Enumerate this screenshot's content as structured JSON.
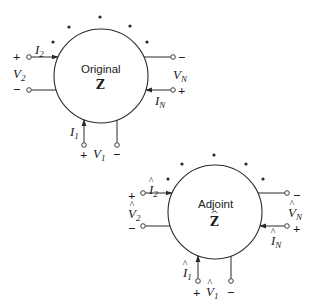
{
  "colors": {
    "stroke": "#2a2a2a",
    "background": "#ffffff"
  },
  "networks": [
    {
      "id": "original",
      "title": "Original",
      "matrix": "Z",
      "hat": false,
      "circle": {
        "cx": 101,
        "cy": 76,
        "r": 47
      },
      "dots": [
        [
          53,
          42
        ],
        [
          69,
          27
        ],
        [
          100,
          17
        ],
        [
          130,
          26
        ],
        [
          147,
          42
        ]
      ],
      "ports": {
        "port2": {
          "current": "I",
          "current_sub": "2",
          "voltage": "V",
          "voltage_sub": "2",
          "plus": "+",
          "minus": "−"
        },
        "portN": {
          "current": "I",
          "current_sub": "N",
          "voltage": "V",
          "voltage_sub": "N",
          "plus": "+",
          "minus": "−"
        },
        "port1": {
          "current": "I",
          "current_sub": "1",
          "voltage": "V",
          "voltage_sub": "1",
          "plus": "+",
          "minus": "−"
        }
      }
    },
    {
      "id": "adjoint",
      "title": "Adjoint",
      "matrix": "Z",
      "hat": true,
      "hat_glyph": "^",
      "circle": {
        "cx": 215,
        "cy": 212,
        "r": 47
      },
      "dots": [
        [
          168,
          179
        ],
        [
          182,
          164
        ],
        [
          214,
          155
        ],
        [
          246,
          164
        ],
        [
          263,
          179
        ]
      ],
      "ports": {
        "port2": {
          "current": "I",
          "current_sub": "2",
          "voltage": "V",
          "voltage_sub": "2",
          "plus": "+",
          "minus": "−"
        },
        "portN": {
          "current": "I",
          "current_sub": "N",
          "voltage": "V",
          "voltage_sub": "N",
          "plus": "+",
          "minus": "−"
        },
        "port1": {
          "current": "I",
          "current_sub": "1",
          "voltage": "V",
          "voltage_sub": "1",
          "plus": "+",
          "minus": "−"
        }
      }
    }
  ]
}
